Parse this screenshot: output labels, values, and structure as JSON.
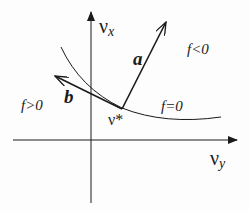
{
  "diagram": {
    "axes": {
      "vertical": {
        "symbol": "ν",
        "subscript": "x"
      },
      "horizontal": {
        "symbol": "ν",
        "subscript": "y"
      }
    },
    "point": {
      "label": "ν*"
    },
    "vectors": [
      {
        "name": "a",
        "label": "a"
      },
      {
        "name": "b",
        "label": "b"
      }
    ],
    "curve": {
      "label": "f=0"
    },
    "regions": [
      {
        "label": "f<0",
        "side": "upper-right"
      },
      {
        "label": "f>0",
        "side": "left"
      }
    ],
    "colors": {
      "ink": "#1a1a1a",
      "background": "#fdfdfd"
    }
  }
}
